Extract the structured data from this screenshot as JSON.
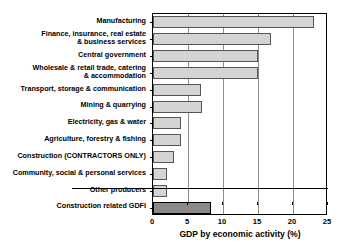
{
  "chart_data": {
    "type": "bar",
    "orientation": "horizontal",
    "title": "",
    "xlabel": "GDP by economic activity (%)",
    "ylabel": "",
    "xlim": [
      0,
      25
    ],
    "xticks": [
      0,
      5,
      10,
      15,
      20,
      25
    ],
    "grid": true,
    "legend": false,
    "categories": [
      "Manufacturing",
      "Finance, insurance, real estate\n& business services",
      "Central government",
      "Wholesale & retail trade, catering\n& accommodation",
      "Transport, storage & communication",
      "Mining & quarrying",
      "Electricity, gas & water",
      "Agriculture, forestry & fishing",
      "Construction (CONTRACTORS ONLY)",
      "Community, social & personal services",
      "Other producers",
      "Construction related GDFI"
    ],
    "values": [
      23.0,
      16.8,
      15.0,
      15.0,
      6.9,
      7.0,
      4.0,
      4.0,
      3.0,
      2.0,
      2.0,
      8.3
    ],
    "series": [
      {
        "name": "GDP by economic activity (%)",
        "values": [
          23.0,
          16.8,
          15.0,
          15.0,
          6.9,
          7.0,
          4.0,
          4.0,
          3.0,
          2.0,
          2.0,
          8.3
        ]
      }
    ],
    "highlight_index": 11,
    "colors": {
      "bar_fill": "#d4d4d4",
      "bar_border": "#555555",
      "accent_fill": "#8a8a8a",
      "accent_border": "#000000",
      "gridline": "#8c8c8c",
      "axis": "#000000"
    },
    "annotations": [
      "Horizontal separator line drawn above the 'Construction related GDFI' bar"
    ]
  }
}
